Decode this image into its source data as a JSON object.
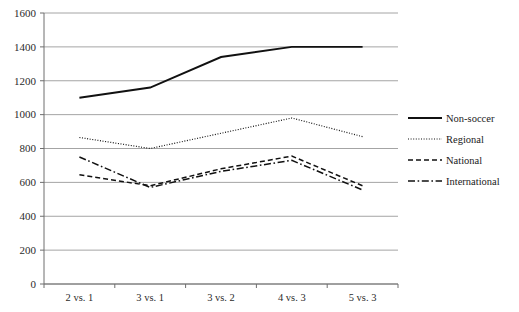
{
  "chart_data": {
    "type": "line",
    "title": "",
    "xlabel": "",
    "ylabel": "",
    "categories": [
      "2 vs. 1",
      "3 vs. 1",
      "3 vs. 2",
      "4 vs. 3",
      "5 vs. 3"
    ],
    "ylim": [
      0,
      1600
    ],
    "yticks": [
      0,
      200,
      400,
      600,
      800,
      1000,
      1200,
      1400,
      1600
    ],
    "ytick_labels": [
      "0",
      "200",
      "400",
      "600",
      "800",
      "1000",
      "1200",
      "1400",
      "1600"
    ],
    "grid": true,
    "legend_position": "right",
    "series": [
      {
        "name": "Non-soccer",
        "line_style": "solid",
        "color": "#111111",
        "values": [
          1100,
          1160,
          1340,
          1400,
          1400
        ]
      },
      {
        "name": "Regional",
        "line_style": "dotted",
        "color": "#111111",
        "values": [
          865,
          800,
          890,
          980,
          870
        ]
      },
      {
        "name": "National",
        "line_style": "dashed",
        "color": "#111111",
        "values": [
          645,
          580,
          680,
          755,
          580
        ]
      },
      {
        "name": "International",
        "line_style": "dash-dot",
        "color": "#111111",
        "values": [
          750,
          570,
          665,
          730,
          555
        ]
      }
    ]
  },
  "legend": {
    "entries": [
      {
        "label": "Non-soccer"
      },
      {
        "label": "Regional"
      },
      {
        "label": "National"
      },
      {
        "label": "International"
      }
    ]
  },
  "axes": {
    "y_ticks": [
      "1600",
      "1400",
      "1200",
      "1000",
      "800",
      "600",
      "400",
      "200",
      "0"
    ],
    "x_ticks": [
      "2 vs. 1",
      "3 vs. 1",
      "3 vs. 2",
      "4 vs. 3",
      "5 vs. 3"
    ]
  }
}
